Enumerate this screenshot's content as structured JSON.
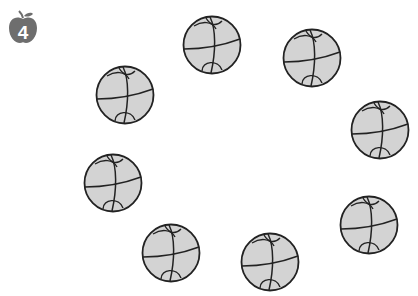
{
  "badge": {
    "icon": "apple-icon",
    "number": "4",
    "color": "#6e6e6e"
  },
  "ball_style": {
    "fill": "#d3d3d3",
    "stroke": "#222222"
  },
  "balls": [
    {
      "x": 212,
      "y": 45
    },
    {
      "x": 312,
      "y": 58
    },
    {
      "x": 125,
      "y": 95
    },
    {
      "x": 380,
      "y": 130
    },
    {
      "x": 113,
      "y": 183
    },
    {
      "x": 369,
      "y": 225
    },
    {
      "x": 171,
      "y": 253
    },
    {
      "x": 270,
      "y": 262
    }
  ],
  "ball_count": 8
}
